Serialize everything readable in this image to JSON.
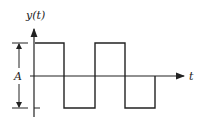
{
  "diagram": {
    "y_axis_label": "y(t)",
    "x_axis_label": "t",
    "amplitude_label": "A",
    "stroke_color": "#222222",
    "waveform": {
      "type": "square",
      "levels": [
        "high",
        "low",
        "high",
        "low"
      ],
      "ends_at": "zero"
    }
  }
}
